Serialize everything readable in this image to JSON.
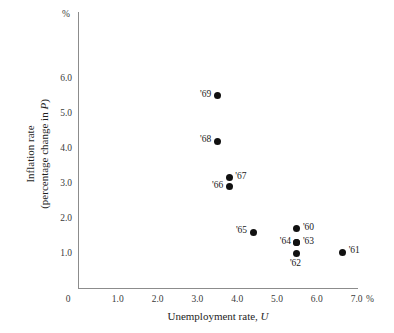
{
  "chart_data": {
    "type": "scatter",
    "title": "",
    "xlabel": "Unemployment rate, U",
    "ylabel": "Inflation rate (percentage change in P)",
    "x_unit": "%",
    "y_unit": "%",
    "xlim": [
      0,
      7.4
    ],
    "ylim": [
      0,
      6.6
    ],
    "grid": false,
    "legend": "none",
    "xticks": [
      "0",
      "1.0",
      "2.0",
      "3.0",
      "4.0",
      "5.0",
      "6.0",
      "7.0"
    ],
    "xtick_values": [
      0,
      1.0,
      2.0,
      3.0,
      4.0,
      5.0,
      6.0,
      7.0
    ],
    "yticks": [
      "1.0",
      "2.0",
      "3.0",
      "4.0",
      "5.0",
      "6.0"
    ],
    "ytick_values": [
      1.0,
      2.0,
      3.0,
      4.0,
      5.0,
      6.0
    ],
    "points": [
      {
        "label": "'69",
        "x": 3.5,
        "y": 5.5,
        "label_pos": "left"
      },
      {
        "label": "'68",
        "x": 3.5,
        "y": 4.2,
        "label_pos": "left"
      },
      {
        "label": "'67",
        "x": 3.8,
        "y": 3.15,
        "label_pos": "right"
      },
      {
        "label": "'66",
        "x": 3.8,
        "y": 2.9,
        "label_pos": "left"
      },
      {
        "label": "'65",
        "x": 4.4,
        "y": 1.6,
        "label_pos": "left"
      },
      {
        "label": "'60",
        "x": 5.5,
        "y": 1.7,
        "label_pos": "right"
      },
      {
        "label": "'64",
        "x": 5.5,
        "y": 1.3,
        "label_pos": "left"
      },
      {
        "label": "'63",
        "x": 5.5,
        "y": 1.3,
        "label_pos": "right"
      },
      {
        "label": "'62",
        "x": 5.5,
        "y": 1.0,
        "label_pos": "below"
      },
      {
        "label": "'61",
        "x": 6.65,
        "y": 1.02,
        "label_pos": "right"
      }
    ],
    "marker_color": "#111111",
    "axis_color": "#8c8c8c",
    "background": "#ffffff"
  },
  "axes": {
    "x_title_main": "Unemployment rate, ",
    "x_title_italic": "U",
    "y_title_line1": "Inflation rate",
    "y_title_line2_pre": "(percentage change in ",
    "y_title_line2_italic": "P",
    "y_title_line2_post": ")",
    "x_unit_label": "%",
    "y_unit_label": "%"
  }
}
